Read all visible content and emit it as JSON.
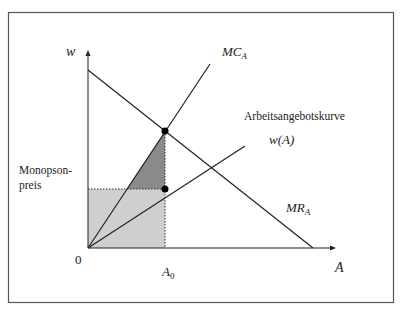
{
  "diagram": {
    "type": "monopsony-labor-market",
    "axes": {
      "y_label": "w",
      "x_label": "A",
      "origin_label": "0"
    },
    "curves": {
      "mc": {
        "label": "MC",
        "subscript": "A"
      },
      "supply": {
        "title": "Arbeitsangebotskurve",
        "label": "w(A)"
      },
      "mr": {
        "label": "MR",
        "subscript": "A"
      }
    },
    "annotations": {
      "price_label_line1": "Monopson-",
      "price_label_line2": "preis",
      "quantity_label": "A",
      "quantity_subscript": "0"
    },
    "colors": {
      "frame": "#555555",
      "lines": "#222222",
      "dark_triangle": "#8a8a8a",
      "light_rect": "#cfcfcf"
    }
  }
}
